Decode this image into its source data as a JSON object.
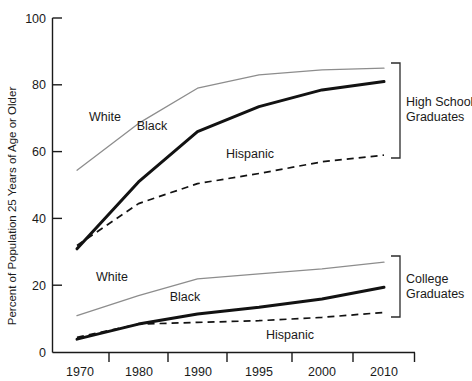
{
  "chart_data": {
    "type": "line",
    "title": "",
    "xlabel": "",
    "ylabel": "Percent of Population 25 Years of Age or Older",
    "x": [
      "1970",
      "1980",
      "1990",
      "1995",
      "2000",
      "2010"
    ],
    "categories": [
      "1970",
      "1980",
      "1990",
      "1995",
      "2000",
      "2010"
    ],
    "ylim": [
      0,
      100
    ],
    "yticks": [
      0,
      20,
      40,
      60,
      80,
      100
    ],
    "ytick_labels": [
      "0",
      "20",
      "40",
      "60",
      "80",
      "100"
    ],
    "grid": false,
    "legend": "inline-labels",
    "groups": [
      {
        "name": "High School Graduates",
        "bracket_label": "High School\nGraduates",
        "series": [
          {
            "name": "White",
            "style": "thin-gray",
            "values": [
              54.5,
              68.5,
              79.0,
              83.0,
              84.5,
              85.0
            ]
          },
          {
            "name": "Black",
            "style": "thick-black",
            "values": [
              31.0,
              51.0,
              66.0,
              73.5,
              78.5,
              81.0
            ]
          },
          {
            "name": "Hispanic",
            "style": "dashed",
            "values": [
              32.0,
              44.5,
              50.5,
              53.5,
              57.0,
              59.0
            ]
          }
        ]
      },
      {
        "name": "College Graduates",
        "bracket_label": "College\nGraduates",
        "series": [
          {
            "name": "White",
            "style": "thin-gray",
            "values": [
              11.0,
              17.0,
              22.0,
              23.5,
              25.0,
              27.0
            ]
          },
          {
            "name": "Black",
            "style": "thick-black",
            "values": [
              4.0,
              8.5,
              11.5,
              13.5,
              16.0,
              19.5
            ]
          },
          {
            "name": "Hispanic",
            "style": "dashed",
            "values": [
              4.5,
              8.5,
              9.0,
              9.5,
              10.5,
              12.0
            ]
          }
        ]
      }
    ],
    "annotations": [
      {
        "text": "White",
        "group": "High School Graduates",
        "x": 105,
        "y": 121
      },
      {
        "text": "Black",
        "group": "High School Graduates",
        "x": 152,
        "y": 130
      },
      {
        "text": "Hispanic",
        "group": "High School Graduates",
        "x": 227,
        "y": 158
      },
      {
        "text": "White",
        "group": "College Graduates",
        "x": 112,
        "y": 281
      },
      {
        "text": "Black",
        "group": "College Graduates",
        "x": 185,
        "y": 301
      },
      {
        "text": "Hispanic",
        "group": "College Graduates",
        "x": 266,
        "y": 334
      }
    ],
    "colors": {
      "white_series": "#8d8d8d",
      "black_series": "#121212",
      "hispanic_series": "#121212",
      "axis": "#1a1a1a",
      "background": "#ffffff"
    }
  }
}
